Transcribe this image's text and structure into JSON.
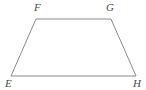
{
  "figure": {
    "name": "trapezoid-EFGH",
    "shape_type": "trapezoid",
    "width": 146,
    "height": 90,
    "background_color": "#ffffff",
    "stroke_color": "#8a8a8a",
    "stroke_width": 1,
    "fill": "none",
    "label_color": "#4a4a4a",
    "vertices": [
      {
        "id": "F",
        "label": "F",
        "x": 36,
        "y": 19,
        "label_x": 34,
        "label_y": 2
      },
      {
        "id": "G",
        "label": "G",
        "x": 111,
        "y": 19,
        "label_x": 106,
        "label_y": 2
      },
      {
        "id": "H",
        "label": "H",
        "x": 136,
        "y": 76,
        "label_x": 133,
        "label_y": 78
      },
      {
        "id": "E",
        "label": "E",
        "x": 11,
        "y": 76,
        "label_x": 5,
        "label_y": 78
      }
    ],
    "edges": [
      {
        "id": "FG",
        "from": "F",
        "to": "G",
        "points": "36,19 111,19"
      },
      {
        "id": "GH",
        "from": "G",
        "to": "H",
        "points": "111,19 136,76"
      },
      {
        "id": "HE",
        "from": "H",
        "to": "E",
        "points": "136,76 11,76"
      },
      {
        "id": "EF",
        "from": "E",
        "to": "F",
        "points": "11,76 36,19"
      }
    ],
    "outline_points": "36,19 111,19 136,76 11,76"
  }
}
